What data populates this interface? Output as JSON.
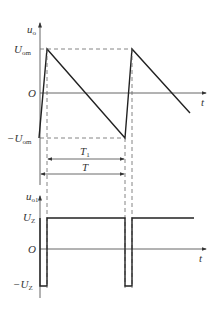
{
  "top_plot": {
    "y_axis_label": "u",
    "y_axis_sub": "o",
    "x_axis_label": "t",
    "ticks": {
      "pos": "U",
      "pos_sub": "om",
      "zero": "O",
      "neg": "−U",
      "neg_sub": "om"
    },
    "waveform": "sawtooth"
  },
  "dimensions": {
    "t1_label": "T",
    "t1_sub": "1",
    "t_label": "T"
  },
  "bottom_plot": {
    "y_axis_label": "u",
    "y_axis_sub": "o1",
    "x_axis_label": "t",
    "ticks": {
      "pos": "U",
      "pos_sub": "Z",
      "zero": "O",
      "neg": "−U",
      "neg_sub": "Z"
    },
    "waveform": "pulse"
  }
}
